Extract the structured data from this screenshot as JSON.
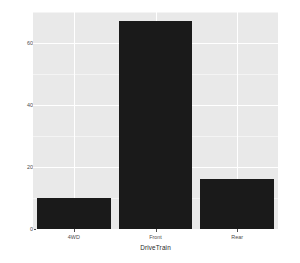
{
  "chart_data": {
    "type": "bar",
    "title": "",
    "subtitle": "",
    "xlabel": "DriveTrain",
    "ylabel": "count",
    "categories": [
      "4WD",
      "Front",
      "Rear"
    ],
    "values": [
      10,
      67,
      16
    ],
    "series": [
      {
        "name": "count",
        "values": [
          10,
          67,
          16
        ]
      }
    ],
    "ylim": [
      0,
      70
    ],
    "xtick_labels": [
      "4WD",
      "Front",
      "Rear"
    ],
    "ytick_labels": [
      "0",
      "20",
      "40",
      "60"
    ],
    "ytick_values": [
      0,
      20,
      40,
      60
    ],
    "yminor_values": [
      10,
      30,
      50,
      70
    ],
    "grid": true,
    "legend": false,
    "legend_position": "none",
    "bar_color": "#1a1a1a",
    "panel_background": "#e9e9e9",
    "gridline_color": "#ffffff",
    "minor_gridline_color": "#f4f4f4",
    "axis_text_color": "#4d4d4d",
    "axis_title_color": "#2b2b2b",
    "plot_background": "#ffffff"
  }
}
